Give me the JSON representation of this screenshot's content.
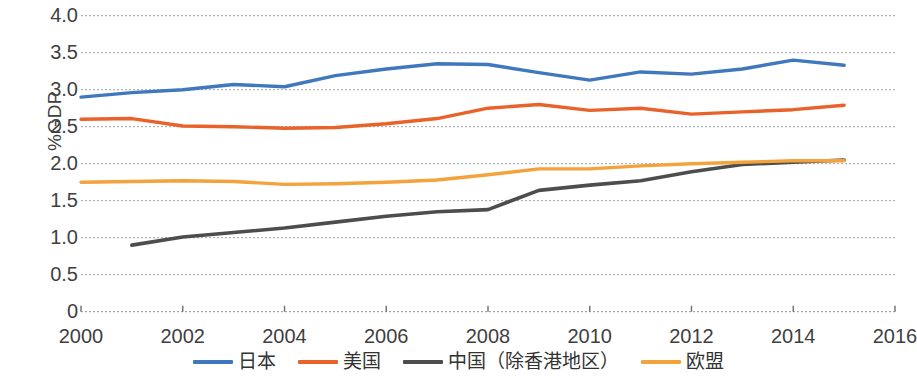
{
  "chart_data": {
    "type": "line",
    "title": "",
    "xlabel": "",
    "ylabel": "%GDP",
    "xlim": [
      2000,
      2016
    ],
    "ylim": [
      0,
      4.0
    ],
    "xticks": [
      "2000",
      "2002",
      "2004",
      "2006",
      "2008",
      "2010",
      "2012",
      "2014",
      "2016"
    ],
    "xtick_values": [
      2000,
      2002,
      2004,
      2006,
      2008,
      2010,
      2012,
      2014,
      2016
    ],
    "yticks": [
      "4.0",
      "3.5",
      "3.0",
      "2.5",
      "2.0",
      "1.5",
      "1.0",
      "0.5",
      "0"
    ],
    "ytick_values": [
      4.0,
      3.5,
      3.0,
      2.5,
      2.0,
      1.5,
      1.0,
      0.5,
      0
    ],
    "grid": "horizontal-dotted",
    "legend_position": "bottom",
    "x": [
      2000,
      2001,
      2002,
      2003,
      2004,
      2005,
      2006,
      2007,
      2008,
      2009,
      2010,
      2011,
      2012,
      2013,
      2014,
      2015
    ],
    "series": [
      {
        "name": "日本",
        "color": "#3f78bd",
        "x": [
          2000,
          2001,
          2002,
          2003,
          2004,
          2005,
          2006,
          2007,
          2008,
          2009,
          2010,
          2011,
          2012,
          2013,
          2014,
          2015
        ],
        "values": [
          2.9,
          2.96,
          3.0,
          3.07,
          3.04,
          3.19,
          3.28,
          3.35,
          3.34,
          3.23,
          3.13,
          3.24,
          3.21,
          3.28,
          3.4,
          3.33
        ]
      },
      {
        "name": "美国",
        "color": "#e8622a",
        "x": [
          2000,
          2001,
          2002,
          2003,
          2004,
          2005,
          2006,
          2007,
          2008,
          2009,
          2010,
          2011,
          2012,
          2013,
          2014,
          2015
        ],
        "values": [
          2.6,
          2.61,
          2.51,
          2.5,
          2.48,
          2.49,
          2.54,
          2.61,
          2.75,
          2.8,
          2.72,
          2.75,
          2.67,
          2.7,
          2.73,
          2.79
        ]
      },
      {
        "name": "中国（除香港地区）",
        "color": "#4d4d4d",
        "x": [
          2001,
          2002,
          2003,
          2004,
          2005,
          2006,
          2007,
          2008,
          2009,
          2010,
          2011,
          2012,
          2013,
          2014,
          2015
        ],
        "values": [
          0.9,
          1.01,
          1.07,
          1.13,
          1.21,
          1.29,
          1.35,
          1.38,
          1.64,
          1.71,
          1.77,
          1.89,
          1.99,
          2.02,
          2.05
        ]
      },
      {
        "name": "欧盟",
        "color": "#f4a23c",
        "x": [
          2000,
          2001,
          2002,
          2003,
          2004,
          2005,
          2006,
          2007,
          2008,
          2009,
          2010,
          2011,
          2012,
          2013,
          2014,
          2015
        ],
        "values": [
          1.75,
          1.76,
          1.77,
          1.76,
          1.72,
          1.73,
          1.75,
          1.78,
          1.85,
          1.93,
          1.93,
          1.97,
          2.0,
          2.02,
          2.04,
          2.04
        ]
      }
    ]
  },
  "legend": {
    "items": [
      {
        "label": "日本",
        "color": "#3f78bd"
      },
      {
        "label": "美国",
        "color": "#e8622a"
      },
      {
        "label": "中国（除香港地区）",
        "color": "#4d4d4d"
      },
      {
        "label": "欧盟",
        "color": "#f4a23c"
      }
    ]
  }
}
